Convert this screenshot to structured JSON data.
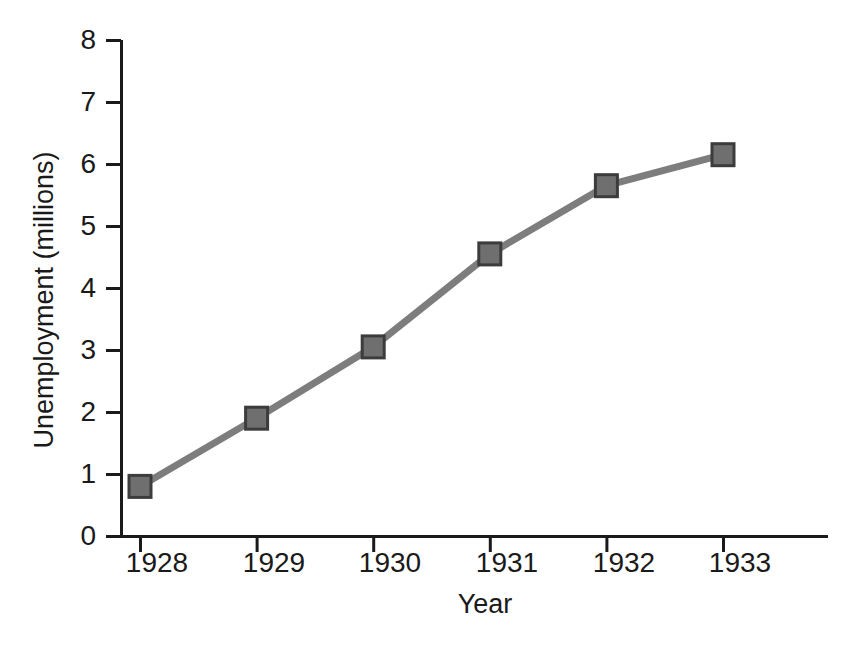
{
  "chart_data": {
    "type": "line",
    "title": "",
    "xlabel": "Year",
    "ylabel": "Unemployment (millions)",
    "categories": [
      "1928",
      "1929",
      "1930",
      "1931",
      "1932",
      "1933"
    ],
    "x": [
      1928,
      1929,
      1930,
      1931,
      1932,
      1933
    ],
    "values": [
      0.8,
      1.9,
      3.05,
      4.55,
      5.65,
      6.15
    ],
    "series": [
      {
        "name": "Unemployment",
        "values": [
          0.8,
          1.9,
          3.05,
          4.55,
          5.65,
          6.15
        ]
      }
    ],
    "ylim": [
      0,
      8
    ],
    "yticks": [
      0,
      1,
      2,
      3,
      4,
      5,
      6,
      7,
      8
    ],
    "ytick_labels": [
      "0",
      "1",
      "2",
      "3",
      "4",
      "5",
      "6",
      "7",
      "8"
    ],
    "xtick_labels": [
      "1928",
      "1929",
      "1930",
      "1931",
      "1932",
      "1933"
    ],
    "grid": false,
    "legend": false,
    "legend_position": "none",
    "marker": "square",
    "line_color": "#7d7d7d",
    "marker_fill": "#6f6f6f",
    "marker_edge": "#3c3c3c",
    "axis_color": "#1a1a1a",
    "background": "#ffffff"
  }
}
